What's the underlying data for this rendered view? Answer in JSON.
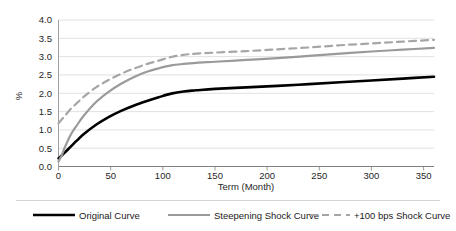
{
  "chart_data": {
    "type": "line",
    "title": "",
    "xlabel": "Term (Month)",
    "ylabel": "%",
    "xlim": [
      0,
      360
    ],
    "ylim": [
      0,
      4.0
    ],
    "grid": "horizontal",
    "legend_position": "bottom",
    "xticks": [
      "0",
      "50",
      "100",
      "150",
      "200",
      "250",
      "300",
      "350"
    ],
    "xtick_values": [
      0,
      50,
      100,
      150,
      200,
      250,
      300,
      350
    ],
    "yticks": [
      "0.0",
      "0.5",
      "1.0",
      "1.5",
      "2.0",
      "2.5",
      "3.0",
      "3.5",
      "4.0"
    ],
    "ytick_values": [
      0.0,
      0.5,
      1.0,
      1.5,
      2.0,
      2.5,
      3.0,
      3.5,
      4.0
    ],
    "x": [
      0,
      3,
      6,
      12,
      18,
      24,
      36,
      48,
      60,
      72,
      84,
      96,
      108,
      120,
      132,
      150,
      180,
      210,
      240,
      270,
      300,
      330,
      360
    ],
    "series": [
      {
        "name": "Original Curve",
        "color": "#000000",
        "style": "solid",
        "width": 2.6,
        "values": [
          0.22,
          0.3,
          0.38,
          0.55,
          0.72,
          0.88,
          1.14,
          1.35,
          1.52,
          1.66,
          1.78,
          1.89,
          1.99,
          2.05,
          2.08,
          2.12,
          2.16,
          2.2,
          2.25,
          2.3,
          2.35,
          2.4,
          2.45
        ]
      },
      {
        "name": "Steepening Shock Curve",
        "color": "#9a9a9a",
        "style": "solid",
        "width": 2.2,
        "values": [
          0.14,
          0.3,
          0.52,
          0.88,
          1.14,
          1.38,
          1.76,
          2.04,
          2.26,
          2.44,
          2.58,
          2.68,
          2.76,
          2.8,
          2.83,
          2.86,
          2.91,
          2.96,
          3.02,
          3.08,
          3.14,
          3.19,
          3.24
        ]
      },
      {
        "name": "+100 bps Shock Curve",
        "color": "#a6a6a6",
        "style": "dashed",
        "width": 2.2,
        "values": [
          1.18,
          1.28,
          1.38,
          1.58,
          1.74,
          1.9,
          2.16,
          2.36,
          2.53,
          2.67,
          2.79,
          2.89,
          2.99,
          3.05,
          3.08,
          3.11,
          3.15,
          3.2,
          3.25,
          3.31,
          3.36,
          3.41,
          3.46
        ]
      }
    ]
  },
  "legend": {
    "items": [
      {
        "label": "Original Curve"
      },
      {
        "label": "Steepening Shock Curve"
      },
      {
        "label": "+100 bps Shock Curve"
      }
    ]
  },
  "colors": {
    "background": "#ffffff",
    "gridline": "#d9d9d9",
    "axis": "#808080",
    "text": "#1a1a1a",
    "original": "#000000",
    "steepening": "#9a9a9a",
    "shock": "#a6a6a6"
  }
}
